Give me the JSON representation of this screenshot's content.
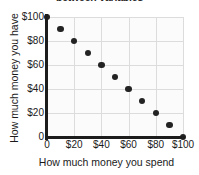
{
  "chart_data": {
    "type": "scatter",
    "title": "between variables",
    "xlabel": "How much money you spend",
    "ylabel": "How much money you have",
    "xlim": [
      0,
      100
    ],
    "ylim": [
      0,
      100
    ],
    "grid": true,
    "legend": false,
    "xticks": [
      0,
      20,
      40,
      60,
      80,
      100
    ],
    "yticks": [
      0,
      20,
      40,
      60,
      80,
      100
    ],
    "xticklabels": [
      "0",
      "$20",
      "$40",
      "$60",
      "$80",
      "$100"
    ],
    "yticklabels": [
      "0",
      "$20",
      "$40",
      "$60",
      "$80",
      "$100"
    ],
    "x": [
      0,
      10,
      20,
      30,
      40,
      50,
      60,
      70,
      80,
      90,
      100
    ],
    "y": [
      100,
      90,
      80,
      70,
      60,
      50,
      40,
      30,
      20,
      10,
      0
    ],
    "points": [
      {
        "x": 0,
        "y": 100
      },
      {
        "x": 10,
        "y": 90
      },
      {
        "x": 20,
        "y": 80
      },
      {
        "x": 30,
        "y": 70
      },
      {
        "x": 40,
        "y": 60
      },
      {
        "x": 50,
        "y": 50
      },
      {
        "x": 60,
        "y": 40
      },
      {
        "x": 70,
        "y": 30
      },
      {
        "x": 80,
        "y": 20
      },
      {
        "x": 90,
        "y": 10
      },
      {
        "x": 100,
        "y": 0
      }
    ],
    "marker_color": "#232323",
    "grid_color": "#dcdcdc",
    "axis_color": "#1c1c1c",
    "background_color": "#ffffff",
    "plot_background_color": "#fbfbfb"
  }
}
